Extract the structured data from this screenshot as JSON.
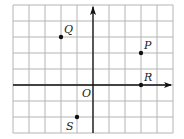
{
  "figure": {
    "type": "coordinate-grid",
    "grid": {
      "columns": 10,
      "rows": 8,
      "cell_size_px": 16,
      "left_px": 13,
      "top_px": 5,
      "line_color": "#b5b5b5",
      "axis_color": "#111111"
    },
    "origin": {
      "label": "O",
      "grid_col": 5,
      "grid_row": 5
    },
    "axes": {
      "x_arrow": true,
      "y_arrow": true
    },
    "points": [
      {
        "label": "Q",
        "x": -2,
        "y": 3
      },
      {
        "label": "P",
        "x": 3,
        "y": 2
      },
      {
        "label": "R",
        "x": 3,
        "y": 0
      },
      {
        "label": "S",
        "x": -1,
        "y": -2
      }
    ]
  }
}
